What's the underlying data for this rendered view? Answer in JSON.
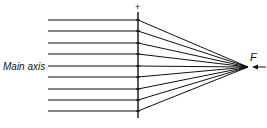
{
  "labels": {
    "main_axis": "Main axis",
    "focal_point": "F",
    "lens_sign": "+"
  },
  "diagram": {
    "type": "converging lens ray diagram",
    "ray_count": 9,
    "ray_y": [
      20,
      31,
      43,
      54,
      66,
      77,
      89,
      100,
      111
    ],
    "ray_start_x": 48,
    "lens_x": 138,
    "lens_top": 12,
    "lens_bottom": 118,
    "focus": {
      "x": 248,
      "y": 67
    },
    "arrow": {
      "from_x": 266,
      "to_x": 252,
      "y": 67
    },
    "line_color": "#111111"
  }
}
